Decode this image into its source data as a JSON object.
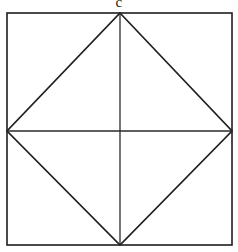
{
  "figure": {
    "label": "c",
    "label_position": "top-center",
    "background_color": "#ffffff",
    "stroke_color": "#1f1f1f",
    "geometry": {
      "square": {
        "left": 7,
        "top": 13,
        "right": 232,
        "bottom": 245,
        "corners": [
          {
            "name": "top-left",
            "x": 7,
            "y": 13
          },
          {
            "name": "top-right",
            "x": 232,
            "y": 13
          },
          {
            "name": "bottom-right",
            "x": 232,
            "y": 245
          },
          {
            "name": "bottom-left",
            "x": 7,
            "y": 245
          }
        ]
      },
      "midpoints": [
        {
          "name": "top-mid",
          "x": 120,
          "y": 13
        },
        {
          "name": "right-mid",
          "x": 232,
          "y": 131
        },
        {
          "name": "bottom-mid",
          "x": 120,
          "y": 245
        },
        {
          "name": "left-mid",
          "x": 7,
          "y": 131
        }
      ],
      "center": {
        "x": 120,
        "y": 131
      },
      "diamond_vertices": [
        {
          "x": 120,
          "y": 13
        },
        {
          "x": 232,
          "y": 131
        },
        {
          "x": 120,
          "y": 245
        },
        {
          "x": 7,
          "y": 131
        }
      ],
      "medians": [
        {
          "name": "vertical-median",
          "x1": 120,
          "y1": 13,
          "x2": 120,
          "y2": 245
        },
        {
          "name": "horizontal-median",
          "x1": 7,
          "y1": 131,
          "x2": 232,
          "y2": 131
        }
      ]
    }
  }
}
